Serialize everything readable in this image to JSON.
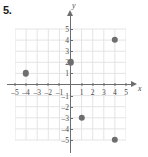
{
  "problem": {
    "number": "5."
  },
  "chart_data": {
    "type": "scatter",
    "title": "",
    "xlabel": "x",
    "ylabel": "y",
    "xlim": [
      -5.5,
      5.5
    ],
    "ylim": [
      -5.5,
      5.5
    ],
    "grid": true,
    "grid_step": 1,
    "legend": "none",
    "xtick_labels": [
      "-5",
      "-4",
      "-3",
      "-2",
      "-1",
      "1",
      "2",
      "3",
      "4",
      "5"
    ],
    "xticks": [
      -5,
      -4,
      -3,
      -2,
      -1,
      1,
      2,
      3,
      4,
      5
    ],
    "ytick_labels": [
      "5",
      "4",
      "3",
      "2",
      "1",
      "-1",
      "-2",
      "-3",
      "-4",
      "-5"
    ],
    "yticks": [
      5,
      4,
      3,
      2,
      1,
      -1,
      -2,
      -3,
      -4,
      -5
    ],
    "points": [
      {
        "x": -4,
        "y": 1
      },
      {
        "x": 0,
        "y": 2
      },
      {
        "x": 4,
        "y": 4
      },
      {
        "x": 1,
        "y": -3
      },
      {
        "x": 4,
        "y": -5
      }
    ],
    "point_color": "#6e6e6e",
    "axis_color": "#6d6d6d",
    "grid_color": "#e4e4e4"
  }
}
